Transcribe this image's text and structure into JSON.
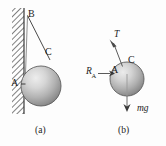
{
  "figure": {
    "panels": [
      {
        "id": "a",
        "caption": "(a)",
        "description": "sphere resting against hatched vertical wall suspended by a string",
        "labels": {
          "wall_top_attachment": "B",
          "string_tangent_point": "C",
          "wall_contact_point": "A"
        }
      },
      {
        "id": "b",
        "caption": "(b)",
        "description": "free body diagram of the sphere",
        "labels": {
          "tension": "T",
          "string_tangent_point": "C",
          "wall_contact_point": "A",
          "reaction_force": "R",
          "reaction_force_subscript": "A",
          "weight": "mg"
        }
      }
    ],
    "colors": {
      "ink": "#1c1c1c",
      "line": "#3a3a3a",
      "sphere_light": "#e8e8e8",
      "sphere_mid": "#b4b4b4",
      "sphere_dark": "#6e6e6e",
      "sphere_edge": "#5a5a5a",
      "hatch": "#4a4a4a",
      "background": "#fdfdfd"
    },
    "geometry": {
      "panel_a": {
        "wall": {
          "x": 12,
          "y": 8,
          "width": 12,
          "height": 106
        },
        "wall_face_x": 24,
        "sphere": {
          "cx": 41,
          "cy": 86,
          "r": 20
        },
        "string_from": {
          "x": 28,
          "y": 16
        },
        "string_to": {
          "x": 50,
          "y": 60
        }
      },
      "panel_b": {
        "sphere": {
          "cx": 127,
          "cy": 79,
          "r": 17
        },
        "tension_arrow": {
          "x1": 122,
          "y1": 66,
          "x2": 112,
          "y2": 40
        },
        "reaction_arrow": {
          "x1": 97,
          "y1": 73,
          "x2": 113,
          "y2": 73
        },
        "weight_arrow": {
          "x1": 127,
          "y1": 73,
          "x2": 127,
          "y2": 110
        }
      }
    }
  }
}
